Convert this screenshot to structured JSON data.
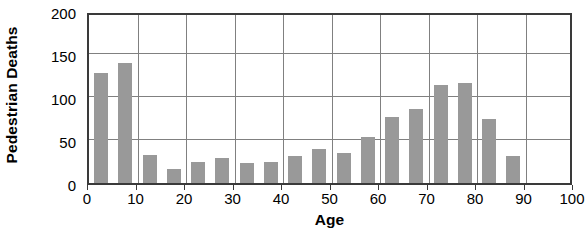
{
  "chart_data": {
    "type": "bar",
    "title": "",
    "xlabel": "Age",
    "ylabel": "Pedestrian Deaths",
    "xlim": [
      0,
      100
    ],
    "ylim": [
      0,
      200
    ],
    "grid": true,
    "legend": "none",
    "bar_color": "#999999",
    "frame_color": "#3a3a3a",
    "gridline_color": "#808080",
    "bin_width": 5,
    "xticks": [
      0,
      10,
      20,
      30,
      40,
      50,
      60,
      70,
      80,
      90,
      100
    ],
    "xtick_labels": [
      "0",
      "10",
      "20",
      "30",
      "40",
      "50",
      "60",
      "70",
      "80",
      "90",
      "100"
    ],
    "yticks": [
      0,
      50,
      100,
      150,
      200
    ],
    "ytick_labels": [
      "0",
      "50",
      "100",
      "150",
      "200"
    ],
    "categories": [
      "0-5",
      "5-10",
      "10-15",
      "15-20",
      "20-25",
      "25-30",
      "30-35",
      "35-40",
      "40-45",
      "45-50",
      "50-55",
      "55-60",
      "60-65",
      "65-70",
      "70-75",
      "75-80",
      "80-85",
      "85-90"
    ],
    "bin_starts": [
      0,
      5,
      10,
      15,
      20,
      25,
      30,
      35,
      40,
      45,
      50,
      55,
      60,
      65,
      70,
      75,
      80,
      85
    ],
    "values": [
      128,
      139,
      32,
      16,
      24,
      29,
      23,
      25,
      31,
      39,
      35,
      54,
      77,
      86,
      114,
      116,
      74,
      31
    ]
  }
}
